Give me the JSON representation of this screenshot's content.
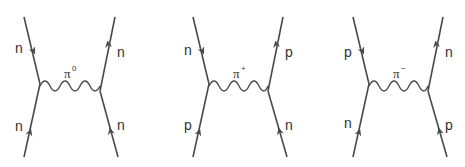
{
  "colors": {
    "line": "#4a4a4a",
    "text": "#333333",
    "background": "#ffffff"
  },
  "diagrams": [
    {
      "exchange_particle": "π",
      "exchange_charge": "0",
      "top_left": "n",
      "bottom_left": "n",
      "top_right": "n",
      "bottom_right": "n"
    },
    {
      "exchange_particle": "π",
      "exchange_charge": "+",
      "top_left": "n",
      "bottom_left": "p",
      "top_right": "p",
      "bottom_right": "n"
    },
    {
      "exchange_particle": "π",
      "exchange_charge": "−",
      "top_left": "p",
      "bottom_left": "n",
      "top_right": "n",
      "bottom_right": "p"
    }
  ]
}
